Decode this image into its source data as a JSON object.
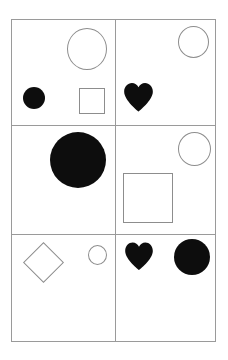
{
  "figure": {
    "title": "",
    "background_color": "#ffffff",
    "grid": {
      "rows": 3,
      "columns": 2,
      "border_color": "#9a9a9a",
      "line_color": "#9a9a9a",
      "line_width_px": 1
    },
    "palette": {
      "fill_black": "#0d0d0d",
      "outline_gray": "#8d8d8d",
      "frame_gray": "#9a9a9a"
    }
  },
  "cells": [
    {
      "id": "r1c1",
      "row": 1,
      "column": 1,
      "position": "top-left",
      "shape_count": 3,
      "shapes": [
        {
          "name": "circle",
          "style": "outline",
          "color": "#8d8d8d",
          "size": "large",
          "placement": "top-right"
        },
        {
          "name": "circle",
          "style": "filled",
          "color": "#0d0d0d",
          "size": "small",
          "placement": "bottom-left"
        },
        {
          "name": "square",
          "style": "outline",
          "color": "#8d8d8d",
          "size": "small",
          "placement": "bottom-right"
        }
      ]
    },
    {
      "id": "r1c2",
      "row": 1,
      "column": 2,
      "position": "top-right",
      "shape_count": 2,
      "shapes": [
        {
          "name": "circle",
          "style": "outline",
          "color": "#8d8d8d",
          "size": "medium",
          "placement": "top-right"
        },
        {
          "name": "heart",
          "style": "filled",
          "color": "#0d0d0d",
          "size": "medium",
          "placement": "bottom-left"
        }
      ]
    },
    {
      "id": "r2c1",
      "row": 2,
      "column": 1,
      "position": "middle-left",
      "shape_count": 1,
      "shapes": [
        {
          "name": "circle",
          "style": "filled",
          "color": "#0d0d0d",
          "size": "extra-large",
          "placement": "top-center-right"
        }
      ]
    },
    {
      "id": "r2c2",
      "row": 2,
      "column": 2,
      "position": "middle-right",
      "shape_count": 2,
      "shapes": [
        {
          "name": "circle",
          "style": "outline",
          "color": "#8d8d8d",
          "size": "medium",
          "placement": "top-right"
        },
        {
          "name": "square",
          "style": "outline",
          "color": "#8d8d8d",
          "size": "large",
          "placement": "center-left"
        }
      ]
    },
    {
      "id": "r3c1",
      "row": 3,
      "column": 1,
      "position": "bottom-left",
      "shape_count": 2,
      "shapes": [
        {
          "name": "diamond",
          "style": "outline",
          "color": "#8d8d8d",
          "size": "medium",
          "placement": "top-left"
        },
        {
          "name": "circle",
          "style": "outline",
          "color": "#8d8d8d",
          "size": "extra-small",
          "placement": "top-right"
        }
      ]
    },
    {
      "id": "r3c2",
      "row": 3,
      "column": 2,
      "position": "bottom-right",
      "shape_count": 2,
      "shapes": [
        {
          "name": "heart",
          "style": "filled",
          "color": "#0d0d0d",
          "size": "medium",
          "placement": "top-left"
        },
        {
          "name": "circle",
          "style": "filled",
          "color": "#0d0d0d",
          "size": "large",
          "placement": "top-right"
        }
      ]
    }
  ]
}
